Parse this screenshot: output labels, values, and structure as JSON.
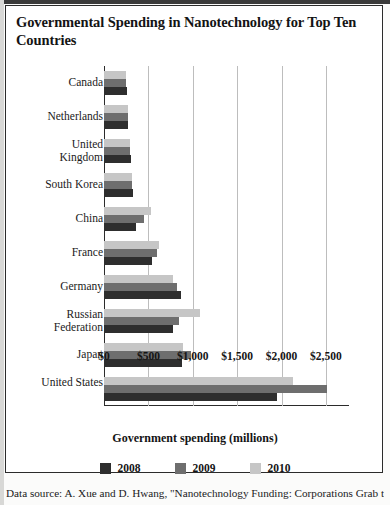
{
  "chart_data": {
    "type": "bar",
    "orientation": "horizontal",
    "title": "Governmental Spending in Nanotechnology for Top Ten Countries",
    "xlabel": "Government spending (millions)",
    "ylabel": "",
    "categories": [
      "Canada",
      "Netherlands",
      "United Kingdom",
      "South Korea",
      "China",
      "France",
      "Germany",
      "Russian Federation",
      "Japan",
      "United States"
    ],
    "series": [
      {
        "name": "2008",
        "color": "#2e2e2e",
        "values": [
          255,
          275,
          300,
          325,
          360,
          545,
          870,
          780,
          880,
          1950
        ]
      },
      {
        "name": "2009",
        "color": "#6e6e6e",
        "values": [
          250,
          270,
          295,
          320,
          445,
          600,
          825,
          850,
          980,
          2510
        ]
      },
      {
        "name": "2010",
        "color": "#c6c6c6",
        "values": [
          250,
          265,
          290,
          310,
          535,
          625,
          780,
          1085,
          895,
          2130
        ]
      }
    ],
    "xlim": [
      0,
      2760
    ],
    "xticks": [
      0,
      500,
      1000,
      1500,
      2000,
      2500
    ],
    "xtick_labels": [
      "$0",
      "$500",
      "$1,000",
      "$1,500",
      "$2,000",
      "$2,500"
    ],
    "grid": "vertical",
    "legend_position": "bottom",
    "legend_entries": [
      "2008",
      "2009",
      "2010"
    ]
  },
  "caption": {
    "text": "Data source: A. Xue and D. Hwang, \"Nanotechnology Funding: Corporations Grab the"
  }
}
